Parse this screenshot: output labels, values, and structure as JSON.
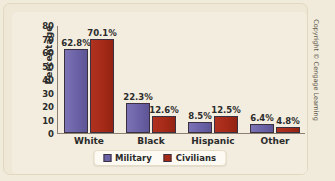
{
  "chart_data": {
    "type": "bar",
    "title": "",
    "xlabel": "",
    "ylabel": "Percentage",
    "ylim": [
      0,
      80
    ],
    "yticks": [
      "80",
      "70",
      "60",
      "50",
      "40",
      "30",
      "20",
      "10",
      "0"
    ],
    "grid": false,
    "legend_position": "bottom-center",
    "categories": [
      "White",
      "Black",
      "Hispanic",
      "Other"
    ],
    "series": [
      {
        "name": "Military",
        "color": "#6a62a6",
        "values": [
          62.8,
          22.3,
          8.5,
          6.4
        ],
        "labels": [
          "62.8%",
          "22.3%",
          "8.5%",
          "6.4%"
        ]
      },
      {
        "name": "Civilians",
        "color": "#a52a17",
        "values": [
          70.1,
          12.6,
          12.5,
          4.8
        ],
        "labels": [
          "70.1%",
          "12.6%",
          "12.5%",
          "4.8%"
        ]
      }
    ]
  },
  "credit": "Copyright © Cengage Learning"
}
